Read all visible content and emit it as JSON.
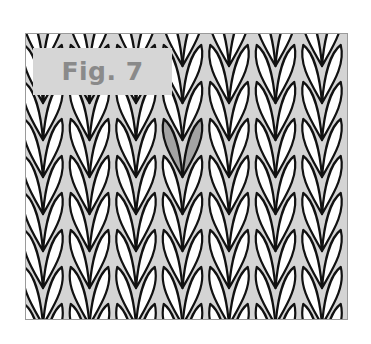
{
  "figure": {
    "label": "Fig. 7",
    "colors": {
      "stitch_fill": "#ffffff",
      "stitch_outline": "#111111",
      "gap_fill": "#d4d4d4",
      "highlight_fill": "#a3a3a3",
      "label_bg": "#d6d6d6",
      "label_text": "#8a8a8a",
      "frame": "#9a9a9a"
    },
    "grid": {
      "columns": 7,
      "rows": 9,
      "column_spacing_px": 46.5,
      "row_spacing_px": 37
    },
    "highlighted_stitch": {
      "column": 4,
      "row": 3
    }
  }
}
